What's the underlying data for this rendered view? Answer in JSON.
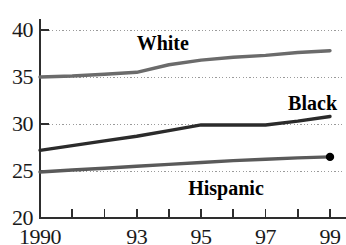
{
  "chart_data": {
    "type": "line",
    "title": "",
    "subtitle": "",
    "xlabel": "",
    "ylabel": "",
    "x": [
      1990,
      1991,
      1992,
      1993,
      1994,
      1995,
      1996,
      1997,
      1998,
      1999
    ],
    "xtick_labels": [
      "1990",
      "",
      "",
      "93",
      "",
      "95",
      "",
      "97",
      "",
      "99"
    ],
    "xtick_values": [
      1990,
      1991,
      1992,
      1993,
      1994,
      1995,
      1996,
      1997,
      1998,
      1999
    ],
    "ytick_labels": [
      "20",
      "25",
      "30",
      "35",
      "40"
    ],
    "ytick_values": [
      20,
      25,
      30,
      35,
      40
    ],
    "ylim": [
      20,
      40
    ],
    "xlim": [
      1990,
      1999
    ],
    "grid": "horizontal-dotted",
    "legend": "inline-annotations",
    "series": [
      {
        "name": "White",
        "color": "#6b6b6b",
        "values": [
          35.0,
          35.1,
          35.3,
          35.5,
          36.3,
          36.8,
          37.1,
          37.3,
          37.6,
          37.8
        ],
        "label_x": 1993.0,
        "label_y": 38.6,
        "endpoint_marker": false
      },
      {
        "name": "Black",
        "color": "#2b2b2b",
        "values": [
          27.2,
          27.7,
          28.2,
          28.7,
          29.3,
          29.9,
          29.9,
          29.9,
          30.3,
          30.8
        ],
        "label_x": 1997.7,
        "label_y": 32.2,
        "endpoint_marker": false
      },
      {
        "name": "Hispanic",
        "color": "#5a5a5a",
        "values": [
          24.9,
          25.1,
          25.3,
          25.5,
          25.7,
          25.9,
          26.1,
          26.25,
          26.4,
          26.5
        ],
        "label_x": 1994.6,
        "label_y": 23.2,
        "endpoint_marker": true
      }
    ]
  },
  "axis": {
    "y_ticks": [
      {
        "label": "40",
        "value": 40
      },
      {
        "label": "35",
        "value": 35
      },
      {
        "label": "30",
        "value": 30
      },
      {
        "label": "25",
        "value": 25
      },
      {
        "label": "20",
        "value": 20
      }
    ],
    "x_ticks": [
      {
        "label": "1990",
        "value": 1990
      },
      {
        "label": "",
        "value": 1991
      },
      {
        "label": "",
        "value": 1992
      },
      {
        "label": "93",
        "value": 1993
      },
      {
        "label": "",
        "value": 1994
      },
      {
        "label": "95",
        "value": 1995
      },
      {
        "label": "",
        "value": 1996
      },
      {
        "label": "97",
        "value": 1997
      },
      {
        "label": "",
        "value": 1998
      },
      {
        "label": "99",
        "value": 1999
      }
    ]
  },
  "colors": {
    "axis": "#2e2e2e",
    "grid": "#9a9a9a",
    "white_series": "#6b6b6b",
    "black_series": "#2b2b2b",
    "hispanic_series": "#5a5a5a",
    "text": "#1a1a1a",
    "background": "#ffffff"
  }
}
